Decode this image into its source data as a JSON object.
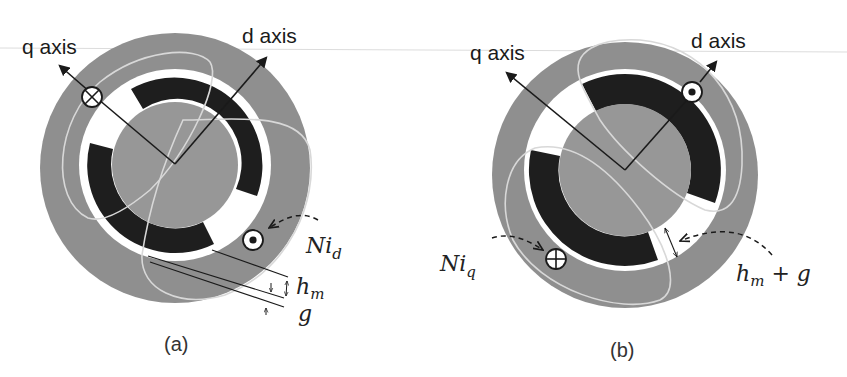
{
  "figure": {
    "colors": {
      "stator": "#8f8f8f",
      "rotor": "#979797",
      "magnet": "#1e1e1e",
      "air_gap": "#ffffff",
      "winding": "#d8d8d8",
      "axis_line": "#1a1a1a"
    },
    "panels": [
      {
        "id": "a",
        "caption": "(a)",
        "q_axis_label": "q axis",
        "d_axis_label": "d axis",
        "current_label_main": "Ni",
        "current_label_sub": "d",
        "current_symbols": [
          {
            "name": "cross",
            "symbol": "⊗"
          },
          {
            "name": "dot",
            "symbol": "⊙"
          }
        ],
        "dimension_labels": [
          {
            "main": "h",
            "sub": "m"
          },
          {
            "main": "g",
            "sub": ""
          }
        ]
      },
      {
        "id": "b",
        "caption": "(b)",
        "q_axis_label": "q axis",
        "d_axis_label": "d axis",
        "current_label_main": "Ni",
        "current_label_sub": "q",
        "current_symbols": [
          {
            "name": "dot",
            "symbol": "⊙"
          },
          {
            "name": "cross",
            "symbol": "⊗"
          }
        ],
        "dimension_labels": [
          {
            "main": "h",
            "sub": "m",
            "suffix": " + g"
          }
        ]
      }
    ]
  }
}
